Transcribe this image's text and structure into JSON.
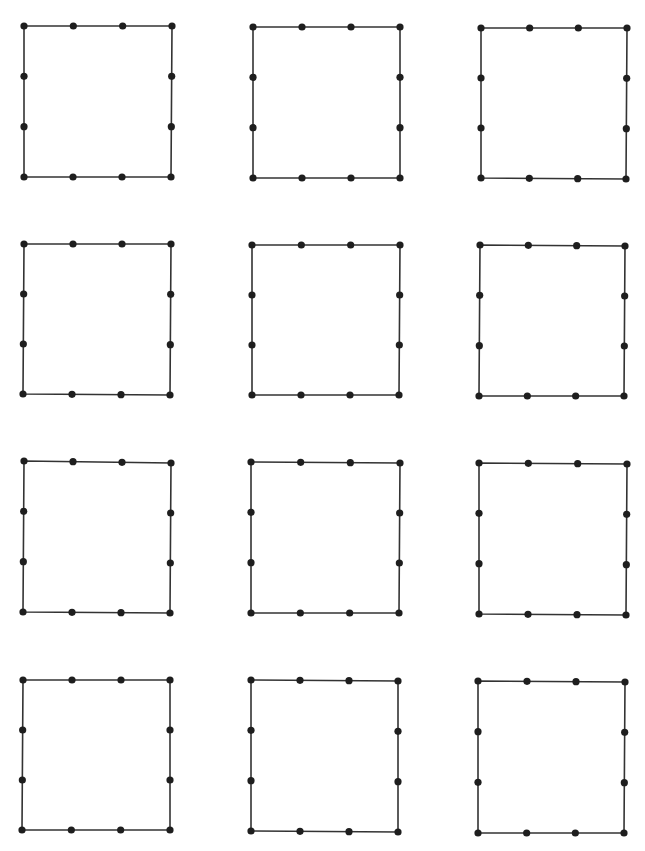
{
  "header": {
    "title_clipped": "(title text cut off at top edge — only descenders visible)"
  },
  "style": {
    "line_color": "#333333",
    "dot_color": "#1e1e1e",
    "background": "#ffffff",
    "dot_radius": 3.6,
    "line_width": 1.6
  },
  "grid": {
    "rows": 4,
    "cols": 3,
    "dots_per_side": 4,
    "squares": [
      {
        "id": 1,
        "tl": [
          24,
          26
        ],
        "tr": [
          172,
          26
        ],
        "br": [
          171,
          177
        ],
        "bl": [
          24,
          177
        ]
      },
      {
        "id": 2,
        "tl": [
          253,
          27
        ],
        "tr": [
          400,
          27
        ],
        "br": [
          400,
          178
        ],
        "bl": [
          253,
          178
        ]
      },
      {
        "id": 3,
        "tl": [
          481,
          28
        ],
        "tr": [
          627,
          28
        ],
        "br": [
          626,
          179
        ],
        "bl": [
          481,
          178
        ]
      },
      {
        "id": 4,
        "tl": [
          24,
          244
        ],
        "tr": [
          171,
          244
        ],
        "br": [
          170,
          395
        ],
        "bl": [
          23,
          394
        ]
      },
      {
        "id": 5,
        "tl": [
          252,
          245
        ],
        "tr": [
          400,
          245
        ],
        "br": [
          399,
          395
        ],
        "bl": [
          252,
          395
        ]
      },
      {
        "id": 6,
        "tl": [
          480,
          245
        ],
        "tr": [
          625,
          246
        ],
        "br": [
          624,
          396
        ],
        "bl": [
          479,
          396
        ]
      },
      {
        "id": 7,
        "tl": [
          24,
          461
        ],
        "tr": [
          171,
          463
        ],
        "br": [
          170,
          613
        ],
        "bl": [
          23,
          612
        ]
      },
      {
        "id": 8,
        "tl": [
          251,
          462
        ],
        "tr": [
          400,
          463
        ],
        "br": [
          399,
          613
        ],
        "bl": [
          251,
          613
        ]
      },
      {
        "id": 9,
        "tl": [
          479,
          463
        ],
        "tr": [
          627,
          464
        ],
        "br": [
          626,
          615
        ],
        "bl": [
          479,
          614
        ]
      },
      {
        "id": 10,
        "tl": [
          23,
          680
        ],
        "tr": [
          170,
          680
        ],
        "br": [
          170,
          830
        ],
        "bl": [
          22,
          830
        ]
      },
      {
        "id": 11,
        "tl": [
          251,
          680
        ],
        "tr": [
          398,
          681
        ],
        "br": [
          398,
          832
        ],
        "bl": [
          251,
          831
        ]
      },
      {
        "id": 12,
        "tl": [
          478,
          681
        ],
        "tr": [
          625,
          682
        ],
        "br": [
          624,
          833
        ],
        "bl": [
          478,
          833
        ]
      }
    ]
  }
}
